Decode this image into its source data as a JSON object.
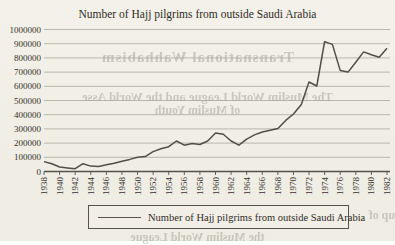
{
  "page": {
    "background_color": "#f2efe8"
  },
  "chart": {
    "title": "Number of Hajj pilgrims from outside Saudi Arabia",
    "legend": {
      "label": "Number of Hajj pilgrims from outside Saudi Arabia"
    },
    "colors": {
      "line": "#504e46",
      "grid": "#aba79c",
      "axis": "#55524a",
      "text": "#33312b"
    }
  },
  "chart_data": {
    "type": "line",
    "title": "Number of Hajj pilgrims from outside Saudi Arabia",
    "xlabel": "",
    "ylabel": "",
    "ylim": [
      0,
      1000000
    ],
    "ytick_step": 100000,
    "grid": true,
    "legend_position": "bottom",
    "xtick_labels": [
      "1938",
      "1940",
      "1942",
      "1944",
      "1946",
      "1948",
      "1950",
      "1952",
      "1954",
      "1956",
      "1958",
      "1960",
      "1962",
      "1964",
      "1966",
      "1968",
      "1970",
      "1972",
      "1974",
      "1976",
      "1978",
      "1980",
      "1982"
    ],
    "x": [
      1938,
      1939,
      1940,
      1941,
      1942,
      1943,
      1944,
      1945,
      1946,
      1947,
      1948,
      1949,
      1950,
      1951,
      1952,
      1953,
      1954,
      1955,
      1956,
      1957,
      1958,
      1959,
      1960,
      1961,
      1962,
      1963,
      1964,
      1965,
      1966,
      1967,
      1968,
      1969,
      1970,
      1971,
      1972,
      1973,
      1974,
      1975,
      1976,
      1977,
      1978,
      1979,
      1980,
      1981,
      1982
    ],
    "series": [
      {
        "name": "Number of Hajj pilgrims from outside Saudi Arabia",
        "values": [
          70000,
          55000,
          32000,
          25000,
          20000,
          55000,
          38000,
          36000,
          48000,
          58000,
          72000,
          85000,
          100000,
          105000,
          140000,
          160000,
          175000,
          215000,
          185000,
          197000,
          190000,
          215000,
          272000,
          262000,
          215000,
          185000,
          228000,
          258000,
          278000,
          290000,
          302000,
          360000,
          405000,
          472000,
          630000,
          602000,
          915000,
          895000,
          712000,
          700000,
          770000,
          842000,
          822000,
          805000,
          868000
        ]
      }
    ]
  },
  "bleedthrough": {
    "line1": "Transnational Wahhabism",
    "line2": "The Muslim World League and the World Asse",
    "line3": "of Muslim Youth",
    "line4": "up of",
    "line5": "the Muslim World League"
  }
}
